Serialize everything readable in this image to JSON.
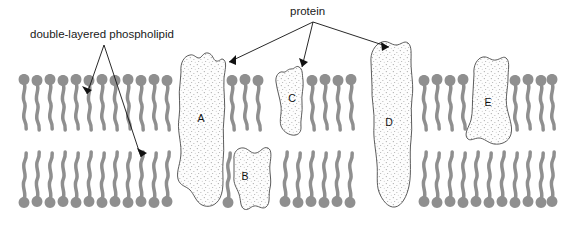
{
  "diagram": {
    "title_visible": false,
    "annotations": [
      {
        "id": "phospholipid-label",
        "text": "double-layered phospholipid",
        "x": 30,
        "y": 38,
        "arrow_targets": [
          {
            "x": 85,
            "y": 97
          },
          {
            "x": 143,
            "y": 161
          }
        ],
        "apex": {
          "x": 104,
          "y": 45
        }
      },
      {
        "id": "protein-label",
        "text": "protein",
        "x": 290,
        "y": 15,
        "arrow_targets": [
          {
            "x": 225,
            "y": 64
          },
          {
            "x": 300,
            "y": 70
          },
          {
            "x": 386,
            "y": 49
          }
        ],
        "apex": {
          "x": 313,
          "y": 22
        }
      }
    ],
    "proteins": [
      {
        "label": "A",
        "label_x": 201,
        "label_y": 122,
        "spans_membrane": true
      },
      {
        "label": "B",
        "label_x": 245,
        "label_y": 178,
        "spans_membrane": false
      },
      {
        "label": "C",
        "label_x": 292,
        "label_y": 100,
        "spans_membrane": false
      },
      {
        "label": "D",
        "label_x": 389,
        "label_y": 124,
        "spans_membrane": true
      },
      {
        "label": "E",
        "label_x": 488,
        "label_y": 104,
        "spans_membrane": false
      }
    ],
    "membrane": {
      "left": 18,
      "right": 556,
      "upper_leaflet_top": 72,
      "midline": 139,
      "lower_leaflet_bottom": 210,
      "description": "phospholipid bilayer with heads facing outward and wavy tails facing inward"
    },
    "colors": {
      "phospholipid_gray": "#8f8f8f",
      "protein_fill": "#fdfdfd",
      "protein_outline": "#4a4a4a",
      "stipple": "#9a9a9a",
      "text": "#1a1a1a",
      "background": "#ffffff"
    }
  }
}
